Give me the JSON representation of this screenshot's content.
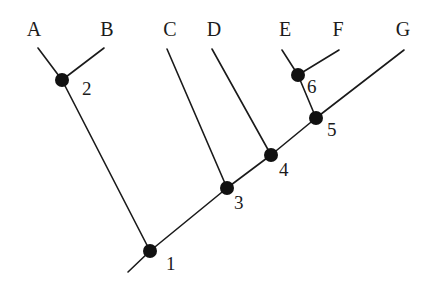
{
  "figure": {
    "name": "phylogenetic-cladogram",
    "background_color": "#ffffff",
    "line_color": "#1a1a1a",
    "node_color": "#111111",
    "width": 437,
    "height": 287
  },
  "chart_data": {
    "type": "diagram",
    "title": "",
    "xlabel": "",
    "ylabel": "",
    "taxa": [
      {
        "id": "A",
        "label": "A",
        "label_x": 34,
        "label_y": 36,
        "tip_x": 38,
        "tip_y": 48
      },
      {
        "id": "B",
        "label": "B",
        "label_x": 107,
        "label_y": 36,
        "tip_x": 104,
        "tip_y": 48
      },
      {
        "id": "C",
        "label": "C",
        "label_x": 170,
        "label_y": 36,
        "tip_x": 167,
        "tip_y": 49
      },
      {
        "id": "D",
        "label": "D",
        "label_x": 214,
        "label_y": 36,
        "tip_x": 212,
        "tip_y": 49
      },
      {
        "id": "E",
        "label": "E",
        "label_x": 285,
        "label_y": 36,
        "tip_x": 282,
        "tip_y": 50
      },
      {
        "id": "F",
        "label": "F",
        "label_x": 338,
        "label_y": 36,
        "tip_x": 339,
        "tip_y": 50
      },
      {
        "id": "G",
        "label": "G",
        "label_x": 403,
        "label_y": 36,
        "tip_x": 404,
        "tip_y": 50
      }
    ],
    "nodes": [
      {
        "id": "1",
        "label": "1",
        "x": 150,
        "y": 251,
        "r": 7,
        "label_x": 166,
        "label_y": 270
      },
      {
        "id": "2",
        "label": "2",
        "x": 62,
        "y": 80,
        "r": 7,
        "label_x": 82,
        "label_y": 95
      },
      {
        "id": "3",
        "label": "3",
        "x": 227,
        "y": 188,
        "r": 7,
        "label_x": 234,
        "label_y": 209
      },
      {
        "id": "4",
        "label": "4",
        "x": 271,
        "y": 155,
        "r": 7,
        "label_x": 279,
        "label_y": 176
      },
      {
        "id": "5",
        "label": "5",
        "x": 316,
        "y": 118,
        "r": 7,
        "label_x": 327,
        "label_y": 136
      },
      {
        "id": "6",
        "label": "6",
        "x": 298,
        "y": 75,
        "r": 7,
        "label_x": 307,
        "label_y": 93
      }
    ],
    "root": {
      "x": 128,
      "y": 272
    },
    "branches": [
      {
        "name": "branch-A-to-node2",
        "x1": 38,
        "y1": 48,
        "x2": 62,
        "y2": 80
      },
      {
        "name": "branch-B-to-node2",
        "x1": 104,
        "y1": 48,
        "x2": 62,
        "y2": 80
      },
      {
        "name": "branch-node2-to-node1",
        "x1": 62,
        "y1": 80,
        "x2": 150,
        "y2": 251
      },
      {
        "name": "branch-C-to-node3",
        "x1": 167,
        "y1": 49,
        "x2": 227,
        "y2": 188
      },
      {
        "name": "branch-D-to-node4",
        "x1": 212,
        "y1": 49,
        "x2": 271,
        "y2": 155
      },
      {
        "name": "branch-E-to-node6",
        "x1": 282,
        "y1": 50,
        "x2": 298,
        "y2": 75
      },
      {
        "name": "branch-F-to-node6",
        "x1": 339,
        "y1": 50,
        "x2": 298,
        "y2": 75
      },
      {
        "name": "branch-node6-to-node5",
        "x1": 298,
        "y1": 75,
        "x2": 316,
        "y2": 118
      },
      {
        "name": "branch-G-to-node5",
        "x1": 404,
        "y1": 50,
        "x2": 316,
        "y2": 118
      },
      {
        "name": "branch-node5-to-node4",
        "x1": 316,
        "y1": 118,
        "x2": 271,
        "y2": 155
      },
      {
        "name": "branch-node4-to-node3",
        "x1": 271,
        "y1": 155,
        "x2": 227,
        "y2": 188
      },
      {
        "name": "branch-node3-to-node1",
        "x1": 227,
        "y1": 188,
        "x2": 150,
        "y2": 251
      },
      {
        "name": "branch-root-stem",
        "x1": 150,
        "y1": 251,
        "x2": 128,
        "y2": 272
      }
    ]
  }
}
